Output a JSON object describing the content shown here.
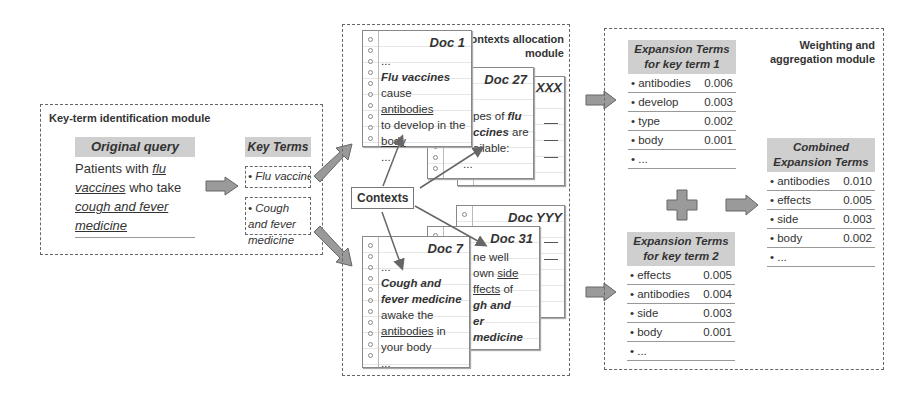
{
  "keyterm_module": {
    "title": "Key-term identification module",
    "original_query": {
      "header": "Original query",
      "text_parts": [
        "Patients with ",
        "flu vaccines",
        " who take ",
        "cough and fever medicine"
      ]
    },
    "key_terms": {
      "header": "Key Terms",
      "items": [
        "• Flu vaccine",
        "• Cough and fever medicine"
      ]
    }
  },
  "contexts_module": {
    "title_line1": "Contexts allocation",
    "title_line2": "module",
    "contexts_label": "Contexts",
    "docs": {
      "doc1": {
        "title": "Doc  1",
        "lines": [
          "...",
          "Flu vaccines",
          "cause ",
          "antibodies",
          "to develop in the",
          "body",
          "..."
        ]
      },
      "doc27": {
        "title": "Doc  27",
        "lines": [
          "pes of ",
          "flu",
          "ccines",
          " are",
          "ailable:",
          "..."
        ]
      },
      "docxxx": {
        "title": "XXX"
      },
      "docyyy": {
        "title": "Doc  YYY"
      },
      "doc31": {
        "title": "Doc  31",
        "lines": [
          "ne well",
          "own ",
          "side",
          "ffects",
          " of",
          "gh and",
          "er medicine"
        ]
      },
      "doc7": {
        "title": "Doc  7",
        "lines": [
          "...",
          "Cough and",
          "fever medicine",
          "awake the",
          "antibodies",
          " in",
          "your body",
          "..."
        ]
      }
    }
  },
  "weighting_module": {
    "title_line1": "Weighting and",
    "title_line2": "aggregation  module",
    "table1": {
      "header1": "Expansion Terms",
      "header2": "for key term 1",
      "rows": [
        {
          "term": "• antibodies",
          "score": "0.006"
        },
        {
          "term": "• develop",
          "score": "0.003"
        },
        {
          "term": "• type",
          "score": "0.002"
        },
        {
          "term": "• body",
          "score": "0.001"
        },
        {
          "term": "• ...",
          "score": ""
        }
      ]
    },
    "table2": {
      "header1": "Expansion Terms",
      "header2": "for key term 2",
      "rows": [
        {
          "term": "• effects",
          "score": "0.005"
        },
        {
          "term": "• antibodies",
          "score": "0.004"
        },
        {
          "term": "• side",
          "score": "0.003"
        },
        {
          "term": "• body",
          "score": "0.001"
        },
        {
          "term": "• ...",
          "score": ""
        }
      ]
    },
    "combined": {
      "header1": "Combined",
      "header2": "Expansion Terms",
      "rows": [
        {
          "term": "• antibodies",
          "score": "0.010"
        },
        {
          "term": "• effects",
          "score": "0.005"
        },
        {
          "term": "• side",
          "score": "0.003"
        },
        {
          "term": "• body",
          "score": "0.002"
        },
        {
          "term": "• ...",
          "score": ""
        }
      ]
    }
  },
  "colors": {
    "header_fill": "#cfcfcf",
    "arrow_fill": "#9a9a9a",
    "border": "#666666"
  }
}
